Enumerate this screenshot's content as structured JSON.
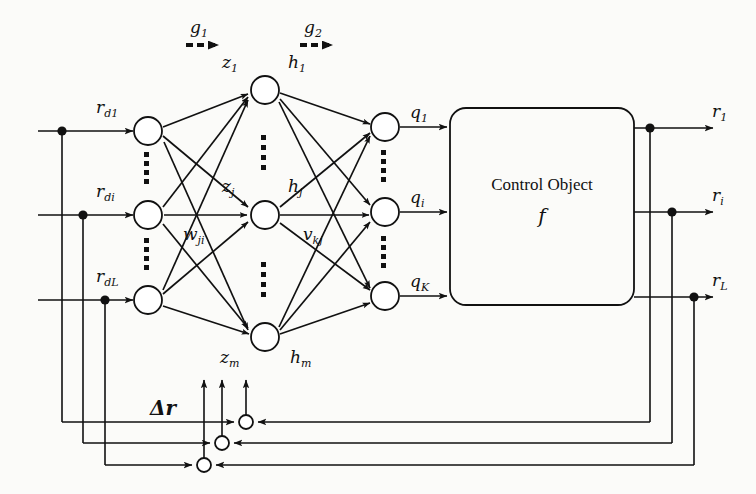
{
  "diagram": {
    "control_object": {
      "label": "Control Object",
      "function_symbol": "f"
    },
    "gradient_arrows": [
      {
        "name": "g1",
        "base": "g",
        "sub": "1"
      },
      {
        "name": "g2",
        "base": "g",
        "sub": "2"
      }
    ],
    "input_layer": {
      "labels": [
        {
          "base": "r",
          "sub": "d1"
        },
        {
          "base": "r",
          "sub": "di"
        },
        {
          "base": "r",
          "sub": "dL"
        }
      ]
    },
    "hidden_layer": {
      "pre_activation_labels": [
        {
          "base": "z",
          "sub": "1"
        },
        {
          "base": "z",
          "sub": "j"
        },
        {
          "base": "z",
          "sub": "m"
        }
      ],
      "activation_labels": [
        {
          "base": "h",
          "sub": "1"
        },
        {
          "base": "h",
          "sub": "j"
        },
        {
          "base": "h",
          "sub": "m"
        }
      ]
    },
    "output_layer": {
      "labels": [
        {
          "base": "q",
          "sub": "1"
        },
        {
          "base": "q",
          "sub": "i"
        },
        {
          "base": "q",
          "sub": "K"
        }
      ]
    },
    "weights": [
      {
        "base": "w",
        "sub": "ji"
      },
      {
        "base": "v",
        "sub": "kj"
      }
    ],
    "outputs": {
      "labels": [
        {
          "base": "r",
          "sub": "1"
        },
        {
          "base": "r",
          "sub": "i"
        },
        {
          "base": "r",
          "sub": "L"
        }
      ]
    },
    "error_signal": {
      "symbol": "Δ",
      "base": "r",
      "full": "Δr"
    },
    "colors": {
      "ink": "#111111",
      "paper": "#fbfbf9"
    }
  }
}
